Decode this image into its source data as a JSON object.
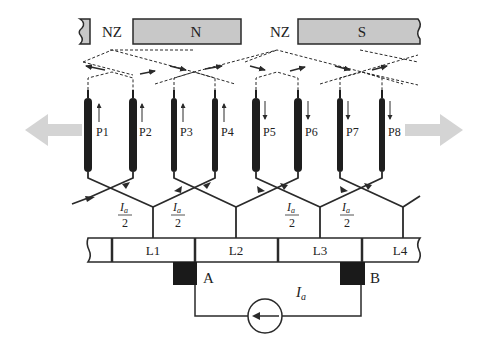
{
  "diagram": {
    "type": "dc-machine-lap-winding-schematic",
    "colors": {
      "pole_fill": "#c8c8c8",
      "stroke": "#2a2a2a",
      "conductor": "#1e1e1e",
      "brush": "#1a1a1a",
      "motion_arrow": "#d4d4d4",
      "background": "#ffffff"
    },
    "poles": [
      {
        "id": "nz-left",
        "label": "NZ"
      },
      {
        "id": "north",
        "label": "N"
      },
      {
        "id": "nz-mid",
        "label": "NZ"
      },
      {
        "id": "south",
        "label": "S"
      }
    ],
    "conductors": [
      {
        "label": "P1",
        "current_direction": "up",
        "thick": true
      },
      {
        "label": "P2",
        "current_direction": "up",
        "thick": true
      },
      {
        "label": "P3",
        "current_direction": "up",
        "thick": false
      },
      {
        "label": "P4",
        "current_direction": "up",
        "thick": false
      },
      {
        "label": "P5",
        "current_direction": "down",
        "thick": true
      },
      {
        "label": "P6",
        "current_direction": "down",
        "thick": true
      },
      {
        "label": "P7",
        "current_direction": "down",
        "thick": false
      },
      {
        "label": "P8",
        "current_direction": "down",
        "thick": false
      }
    ],
    "current_labels": [
      {
        "numerator": "I",
        "subscript": "a",
        "denominator": "2"
      },
      {
        "numerator": "I",
        "subscript": "a",
        "denominator": "2"
      },
      {
        "numerator": "I",
        "subscript": "a",
        "denominator": "2"
      },
      {
        "numerator": "I",
        "subscript": "a",
        "denominator": "2"
      }
    ],
    "commutator_segments": [
      "L1",
      "L2",
      "L3",
      "L4"
    ],
    "brushes": [
      {
        "label": "A"
      },
      {
        "label": "B"
      }
    ],
    "source": {
      "label": "I",
      "subscript": "a",
      "arrow_direction": "left"
    },
    "motion_arrows": [
      "left",
      "right"
    ]
  }
}
